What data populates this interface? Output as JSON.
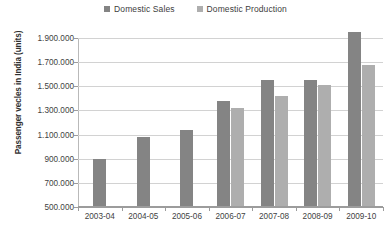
{
  "chart_data": {
    "type": "bar",
    "title": "",
    "xlabel": "",
    "ylabel": "Passenger vecles in India (units)",
    "categories": [
      "2003-04",
      "2004-05",
      "2005-06",
      "2006-07",
      "2007-08",
      "2008-09",
      "2009-10"
    ],
    "series": [
      {
        "name": "Domestic Sales",
        "color": "#848484",
        "values": [
          900000,
          1080000,
          1140000,
          1380000,
          1550000,
          1555000,
          1950000
        ]
      },
      {
        "name": "Domestic Production",
        "color": "#aeaeae",
        "values": [
          null,
          null,
          null,
          1320000,
          1420000,
          1510000,
          1680000
        ]
      }
    ],
    "ylim": [
      500000,
      1900000
    ],
    "ytick_labels": [
      "1.900.000",
      "1.700.000",
      "1.500.000",
      "1.300.000",
      "1.100.000",
      "900.000",
      "700.000",
      "500.000"
    ],
    "ytick_values": [
      1900000,
      1700000,
      1500000,
      1300000,
      1100000,
      900000,
      700000,
      500000
    ],
    "grid": true,
    "legend_position": "top-center"
  },
  "legend": {
    "entries": [
      {
        "label": "Domestic Sales",
        "color": "#848484"
      },
      {
        "label": "Domestic Production",
        "color": "#aeaeae"
      }
    ]
  },
  "axes": {
    "y_title": "Passenger vecles in India (units)"
  }
}
